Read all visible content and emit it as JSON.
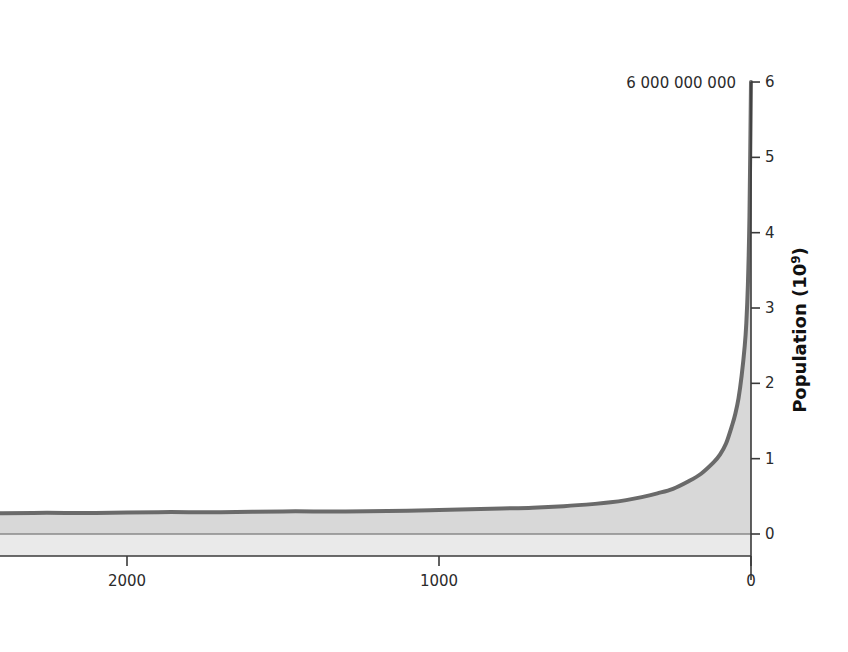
{
  "chart_data": {
    "type": "area",
    "title": "",
    "subtitle": "",
    "xlabel": "",
    "ylabel": "Population (10",
    "ylabel_sup": "9",
    "ylabel_tail": ")",
    "grid": false,
    "legend_position": "none",
    "x_axis": {
      "tick_labels": [
        "2000",
        "1000",
        "0"
      ],
      "tick_values": [
        2000,
        1000,
        0
      ],
      "direction": "descending",
      "range": [
        2700,
        0
      ],
      "units": "years before present"
    },
    "y_axis": {
      "tick_labels": [
        "0",
        "1",
        "2",
        "3",
        "4",
        "5",
        "6"
      ],
      "tick_values": [
        0,
        1,
        2,
        3,
        4,
        5,
        6
      ],
      "range": [
        0,
        6
      ],
      "units": "10^9 people",
      "position": "right"
    },
    "annotations": [
      {
        "name": "peak-population-label",
        "text": "6 000 000 000",
        "x": 0,
        "y": 6
      }
    ],
    "series": [
      {
        "name": "World population",
        "fill_color": "#d8d8d8",
        "line_color": "#6a6a6a",
        "x": [
          2700,
          2500,
          2300,
          2100,
          1900,
          1700,
          1500,
          1300,
          1100,
          1000,
          900,
          800,
          700,
          600,
          500,
          450,
          400,
          350,
          300,
          250,
          200,
          160,
          120,
          100,
          80,
          60,
          50,
          40,
          30,
          20,
          15,
          10,
          5,
          0
        ],
        "values": [
          0.27,
          0.27,
          0.28,
          0.28,
          0.29,
          0.29,
          0.3,
          0.3,
          0.31,
          0.32,
          0.33,
          0.34,
          0.35,
          0.37,
          0.4,
          0.42,
          0.45,
          0.49,
          0.54,
          0.6,
          0.7,
          0.8,
          0.95,
          1.05,
          1.2,
          1.45,
          1.6,
          1.8,
          2.1,
          2.5,
          2.8,
          3.3,
          4.2,
          6.0
        ]
      }
    ]
  },
  "colors": {
    "fill": "#d8d8d8",
    "stroke": "#6a6a6a",
    "axis": "#3a3a3a",
    "text": "#2b2b2b",
    "baseline_band": "#e9e9e9"
  }
}
